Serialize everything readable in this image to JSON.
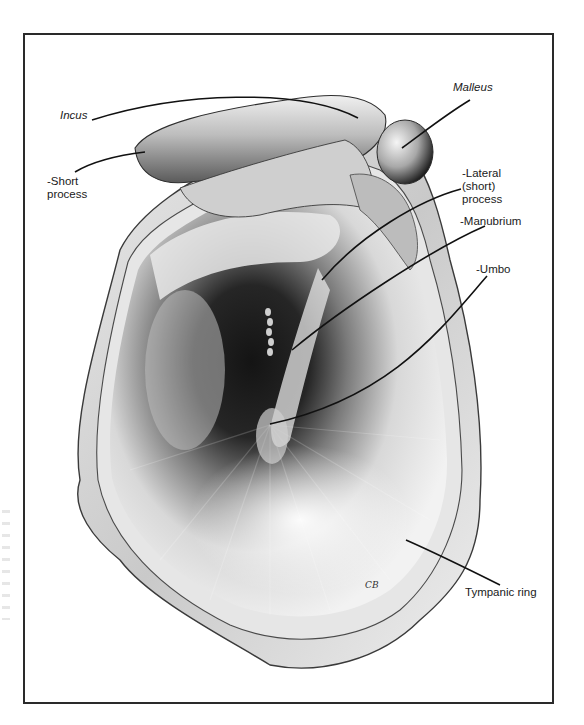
{
  "figure": {
    "frame": {
      "x": 23,
      "y": 33,
      "width": 531,
      "height": 671,
      "color": "#2a2a2a"
    },
    "colors": {
      "ink": "#1a1a1a",
      "shadow": "#111111",
      "membrane_light": "#f4f4f4",
      "ring": "#d9d9d9"
    },
    "signature": "CB"
  },
  "labels": [
    {
      "id": "incus",
      "text": "Incus",
      "italic": true,
      "x": 60,
      "y": 115,
      "leader": [
        [
          92,
          120
        ],
        [
          180,
          92
        ],
        [
          300,
          88
        ],
        [
          358,
          118
        ]
      ]
    },
    {
      "id": "short-process",
      "text": "-Short\nprocess",
      "italic": false,
      "x": 52,
      "y": 175,
      "leader": [
        [
          75,
          172
        ],
        [
          95,
          160
        ],
        [
          120,
          155
        ],
        [
          145,
          152
        ]
      ]
    },
    {
      "id": "malleus",
      "text": "Malleus",
      "italic": true,
      "x": 453,
      "y": 86,
      "leader": [
        [
          470,
          100
        ],
        [
          445,
          115
        ],
        [
          420,
          135
        ],
        [
          402,
          148
        ]
      ]
    },
    {
      "id": "lateral-process",
      "text": "-Lateral\n(short)\nprocess",
      "italic": false,
      "x": 462,
      "y": 170,
      "leader": [
        [
          461,
          189
        ],
        [
          420,
          200
        ],
        [
          360,
          235
        ],
        [
          322,
          280
        ]
      ]
    },
    {
      "id": "manubrium",
      "text": "-Manubrium",
      "italic": false,
      "x": 460,
      "y": 215,
      "leader": [
        [
          485,
          226
        ],
        [
          430,
          250
        ],
        [
          340,
          310
        ],
        [
          292,
          350
        ]
      ]
    },
    {
      "id": "umbo",
      "text": "-Umbo",
      "italic": false,
      "x": 475,
      "y": 263,
      "leader": [
        [
          487,
          276
        ],
        [
          440,
          330
        ],
        [
          390,
          398
        ],
        [
          270,
          424
        ]
      ]
    },
    {
      "id": "tympanic-ring",
      "text": "Tympanic ring",
      "italic": false,
      "x": 465,
      "y": 584,
      "leader": [
        [
          500,
          585
        ],
        [
          470,
          570
        ],
        [
          440,
          555
        ],
        [
          406,
          540
        ]
      ]
    }
  ]
}
